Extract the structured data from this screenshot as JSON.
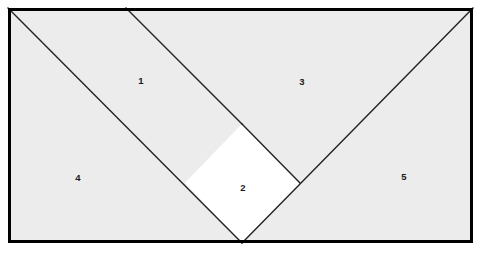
{
  "figure": {
    "type": "geometric-dissection-diagram",
    "canvas": {
      "width": 483,
      "height": 259,
      "background": "#ffffff"
    },
    "colors": {
      "outer_background": "#ffffff",
      "shaded_fill": "#ececec",
      "inner_square_fill": "#ffffff",
      "stroke": "#222222",
      "frame_stroke": "#000000",
      "label_text": "#1a1a1a"
    },
    "frame": {
      "name": "outer-rectangle",
      "x": 8,
      "y": 8,
      "width": 465,
      "height": 235,
      "stroke_width": 3
    },
    "points": {
      "top_left": [
        8,
        8
      ],
      "top_right": [
        473,
        8
      ],
      "bottom_left": [
        8,
        243
      ],
      "bottom_right": [
        473,
        243
      ],
      "top_edge_split": [
        126,
        8
      ],
      "square_top": [
        242,
        124
      ],
      "square_right": [
        300,
        183
      ],
      "square_bottom": [
        242,
        243
      ],
      "square_left": [
        185,
        183
      ]
    },
    "inner_square": {
      "name": "inner-square",
      "fill": "#ffffff",
      "vertices": [
        [
          242,
          124
        ],
        [
          300,
          183
        ],
        [
          242,
          243
        ],
        [
          185,
          183
        ]
      ]
    },
    "regions": [
      {
        "id": "region-1",
        "label": "1",
        "label_x": 141,
        "label_y": 81,
        "fill": "#ececec",
        "polygon": [
          [
            8,
            8
          ],
          [
            126,
            8
          ],
          [
            242,
            124
          ],
          [
            185,
            183
          ]
        ]
      },
      {
        "id": "region-2",
        "label": "2",
        "label_x": 243,
        "label_y": 188,
        "fill": "#ffffff",
        "polygon": [
          [
            242,
            124
          ],
          [
            300,
            183
          ],
          [
            242,
            243
          ],
          [
            185,
            183
          ]
        ]
      },
      {
        "id": "region-3",
        "label": "3",
        "label_x": 302,
        "label_y": 82,
        "fill": "#ececec",
        "polygon": [
          [
            126,
            8
          ],
          [
            473,
            8
          ],
          [
            300,
            183
          ],
          [
            242,
            124
          ]
        ]
      },
      {
        "id": "region-4",
        "label": "4",
        "label_x": 78,
        "label_y": 178,
        "fill": "#ececec",
        "polygon": [
          [
            8,
            8
          ],
          [
            185,
            183
          ],
          [
            242,
            243
          ],
          [
            8,
            243
          ]
        ]
      },
      {
        "id": "region-5",
        "label": "5",
        "label_x": 404,
        "label_y": 177,
        "fill": "#ececec",
        "polygon": [
          [
            473,
            8
          ],
          [
            473,
            243
          ],
          [
            242,
            243
          ],
          [
            300,
            183
          ]
        ]
      }
    ],
    "cut_lines": [
      {
        "id": "diagonal-left",
        "from": [
          8,
          8
        ],
        "to": [
          242,
          243
        ]
      },
      {
        "id": "diagonal-right",
        "from": [
          473,
          8
        ],
        "to": [
          242,
          243
        ]
      },
      {
        "id": "bent-line-upper",
        "from": [
          126,
          8
        ],
        "to": [
          242,
          124
        ]
      },
      {
        "id": "bent-line-lower",
        "from": [
          242,
          124
        ],
        "to": [
          300,
          183
        ]
      }
    ]
  },
  "chart_data": {
    "type": "diagram",
    "title": "",
    "labels": [
      "1",
      "2",
      "3",
      "4",
      "5"
    ]
  }
}
